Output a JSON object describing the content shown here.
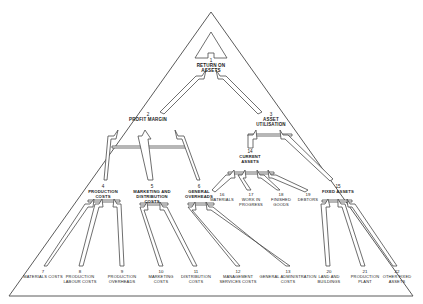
{
  "diagram": {
    "type": "hierarchy-pyramid",
    "background_color": "#ffffff",
    "line_color": "#4a4a4a",
    "text_color": "#1a1a1a",
    "nodes": [
      {
        "id": "n1",
        "num": "1",
        "label": "RETURN ON ASSETS",
        "x": 211,
        "y": 64,
        "level": 0
      },
      {
        "id": "n2",
        "num": "2",
        "label": "PROFIT MARGIN",
        "x": 148,
        "y": 118,
        "level": 1
      },
      {
        "id": "n3",
        "num": "3",
        "label": "ASSET UTILISATION",
        "x": 271,
        "y": 118,
        "level": 1
      },
      {
        "id": "n4",
        "num": "4",
        "label": "PRODUCTION COSTS",
        "x": 103,
        "y": 190,
        "level": 2
      },
      {
        "id": "n5",
        "num": "5",
        "label": "MARKETING AND DISTRIBUTION COSTS",
        "x": 152,
        "y": 190,
        "level": 2
      },
      {
        "id": "n6",
        "num": "6",
        "label": "GENERAL OVERHEADS",
        "x": 199,
        "y": 190,
        "level": 2
      },
      {
        "id": "n7",
        "num": "7",
        "label": "MATERIALS COSTS",
        "x": 43,
        "y": 275,
        "level": 3
      },
      {
        "id": "n8",
        "num": "8",
        "label": "PRODUCTION LABOUR COSTS",
        "x": 80,
        "y": 275,
        "level": 3
      },
      {
        "id": "n9",
        "num": "9",
        "label": "PRODUCTION OVERHEADS",
        "x": 122,
        "y": 275,
        "level": 3
      },
      {
        "id": "n10",
        "num": "10",
        "label": "MARKETING COSTS",
        "x": 161,
        "y": 275,
        "level": 3
      },
      {
        "id": "n11",
        "num": "11",
        "label": "DISTRIBUTION COSTS",
        "x": 196,
        "y": 275,
        "level": 3
      },
      {
        "id": "n12",
        "num": "12",
        "label": "MANAGEMENT SERVICES COSTS",
        "x": 238,
        "y": 275,
        "level": 3
      },
      {
        "id": "n13",
        "num": "13",
        "label": "GENERAL ADMINISTRATION COSTS",
        "x": 288,
        "y": 275,
        "level": 3
      },
      {
        "id": "n14",
        "num": "14",
        "label": "CURRENT ASSETS",
        "x": 250,
        "y": 155,
        "level": 2
      },
      {
        "id": "n15",
        "num": "15",
        "label": "FIXED ASSETS",
        "x": 338,
        "y": 190,
        "level": 2
      },
      {
        "id": "n16",
        "num": "16",
        "label": "MATERIALS",
        "x": 222,
        "y": 198,
        "level": 3
      },
      {
        "id": "n17",
        "num": "17",
        "label": "WORK IN PROGRESS",
        "x": 251,
        "y": 198,
        "level": 3
      },
      {
        "id": "n18",
        "num": "18",
        "label": "FINISHED GOODS",
        "x": 281,
        "y": 198,
        "level": 3
      },
      {
        "id": "n19",
        "num": "19",
        "label": "DEBTORS",
        "x": 308,
        "y": 198,
        "level": 3
      },
      {
        "id": "n20",
        "num": "20",
        "label": "LAND AND BUILDINGS",
        "x": 329,
        "y": 275,
        "level": 3
      },
      {
        "id": "n21",
        "num": "21",
        "label": "PRODUCTION PLANT",
        "x": 365,
        "y": 275,
        "level": 3
      },
      {
        "id": "n22",
        "num": "22",
        "label": "OTHER FIXED ASSETS",
        "x": 397,
        "y": 275,
        "level": 3
      }
    ],
    "edges": [
      {
        "from": "n2",
        "to": "n1"
      },
      {
        "from": "n3",
        "to": "n1"
      },
      {
        "from": "n4",
        "to": "n2"
      },
      {
        "from": "n5",
        "to": "n2"
      },
      {
        "from": "n6",
        "to": "n2"
      },
      {
        "from": "n7",
        "to": "n4"
      },
      {
        "from": "n8",
        "to": "n4"
      },
      {
        "from": "n9",
        "to": "n4"
      },
      {
        "from": "n10",
        "to": "n5"
      },
      {
        "from": "n11",
        "to": "n5"
      },
      {
        "from": "n12",
        "to": "n6"
      },
      {
        "from": "n13",
        "to": "n6"
      },
      {
        "from": "n14",
        "to": "n3"
      },
      {
        "from": "n15",
        "to": "n3"
      },
      {
        "from": "n16",
        "to": "n14"
      },
      {
        "from": "n17",
        "to": "n14"
      },
      {
        "from": "n18",
        "to": "n14"
      },
      {
        "from": "n19",
        "to": "n14"
      },
      {
        "from": "n20",
        "to": "n15"
      },
      {
        "from": "n21",
        "to": "n15"
      },
      {
        "from": "n22",
        "to": "n15"
      }
    ]
  }
}
